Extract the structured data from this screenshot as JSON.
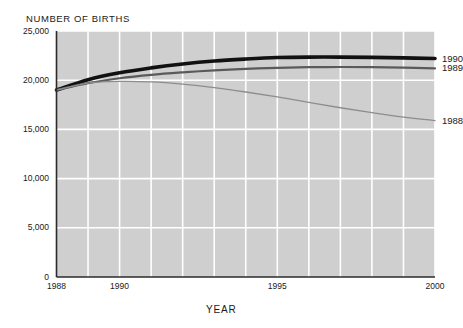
{
  "chart_data": {
    "type": "line",
    "title": "",
    "ylabel": "NUMBER OF BIRTHS",
    "xlabel": "YEAR",
    "xlim": [
      1988,
      2000
    ],
    "ylim": [
      0,
      25000
    ],
    "grid": true,
    "legend_position": "right-of-plot-at-series-end",
    "y_ticks": [
      "0",
      "5,000",
      "10,000",
      "15,000",
      "20,000",
      "25,000"
    ],
    "y_tick_values": [
      0,
      5000,
      10000,
      15000,
      20000,
      25000
    ],
    "x_ticks": [
      "1988",
      "1990",
      "1995",
      "2000"
    ],
    "x_tick_values": [
      1988,
      1990,
      1995,
      2000
    ],
    "x": [
      1988,
      1989,
      1990,
      1991,
      1992,
      1993,
      1994,
      1995,
      1996,
      1997,
      1998,
      1999,
      2000
    ],
    "series": [
      {
        "name": "1990",
        "color": "#111111",
        "width": 3.6,
        "values": [
          19000,
          20050,
          20750,
          21250,
          21650,
          21950,
          22150,
          22300,
          22350,
          22350,
          22320,
          22270,
          22200
        ]
      },
      {
        "name": "1989",
        "color": "#5a5a5a",
        "width": 2.2,
        "values": [
          19000,
          19700,
          20200,
          20550,
          20800,
          21000,
          21150,
          21250,
          21320,
          21340,
          21320,
          21270,
          21200
        ]
      },
      {
        "name": "1988",
        "color": "#8d8d8d",
        "width": 1.3,
        "values": [
          19000,
          19700,
          19880,
          19830,
          19600,
          19250,
          18800,
          18300,
          17750,
          17200,
          16700,
          16250,
          15900
        ]
      }
    ]
  },
  "plot": {
    "bg_color": "#cfcfcf",
    "grid_color": "#ffffff",
    "axis_color": "#2b2b2b",
    "page_bg": "#ffffff"
  },
  "series_labels": [
    {
      "text": "1990"
    },
    {
      "text": "1989"
    },
    {
      "text": "1988"
    }
  ]
}
